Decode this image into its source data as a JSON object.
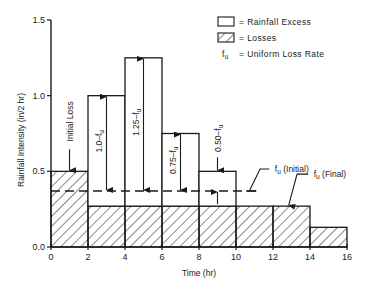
{
  "chart_data": {
    "type": "bar",
    "title": "",
    "xlabel": "Time (hr)",
    "ylabel": "Rainfall Intensity (in/2 hr)",
    "xlim": [
      0,
      16
    ],
    "ylim": [
      0,
      1.5
    ],
    "x_ticks": [
      0,
      2,
      4,
      6,
      8,
      10,
      12,
      14,
      16
    ],
    "x_tick_labels": [
      "0",
      "2",
      "4",
      "6",
      "8",
      "10",
      "12",
      "14",
      "16"
    ],
    "y_ticks": [
      0,
      0.5,
      1.0,
      1.5
    ],
    "y_tick_labels": [
      "0.0",
      "0.5",
      "1.0",
      "1.5"
    ],
    "grid": false,
    "legend_position": "top-right",
    "bars": [
      {
        "x_start": 0,
        "x_end": 2,
        "total": 0.5,
        "loss": 0.5
      },
      {
        "x_start": 2,
        "x_end": 4,
        "total": 1.0,
        "loss": 0.27
      },
      {
        "x_start": 4,
        "x_end": 6,
        "total": 1.25,
        "loss": 0.27
      },
      {
        "x_start": 6,
        "x_end": 8,
        "total": 0.75,
        "loss": 0.27
      },
      {
        "x_start": 8,
        "x_end": 10,
        "total": 0.5,
        "loss": 0.27
      },
      {
        "x_start": 10,
        "x_end": 12,
        "total": 0.27,
        "loss": 0.27
      },
      {
        "x_start": 12,
        "x_end": 14,
        "total": 0.27,
        "loss": 0.27
      },
      {
        "x_start": 14,
        "x_end": 16,
        "total": 0.13,
        "loss": 0.13
      }
    ],
    "fu_initial": {
      "value": 0.37,
      "x_start": 0,
      "x_end": 11.2,
      "label": "f_u (Initial)"
    },
    "fu_final": {
      "value": 0.27,
      "label": "f_u (Final)"
    },
    "annotations": [
      {
        "text": "Initial Loss",
        "x": 1,
        "y_top": 0.5
      },
      {
        "text": "1.0–f",
        "sub": "u",
        "x": 3
      },
      {
        "text": "1.25–f",
        "sub": "u",
        "x": 5
      },
      {
        "text": "0.75–f",
        "sub": "u",
        "x": 7
      },
      {
        "text": "0.50–f",
        "sub": "u",
        "x": 9
      }
    ],
    "legend": [
      {
        "swatch": "open",
        "label": "= Rainfall Excess"
      },
      {
        "swatch": "hatched",
        "label": "= Losses"
      },
      {
        "swatch": "symbol",
        "symbol": "f",
        "sub": "u",
        "label": "= Uniform Loss Rate"
      }
    ]
  },
  "colors": {
    "ink": "#1a1a1a",
    "background": "#ffffff"
  }
}
